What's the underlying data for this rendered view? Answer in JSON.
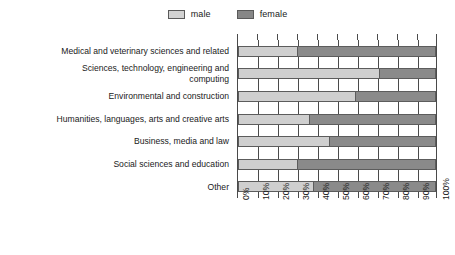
{
  "chart_data": {
    "type": "bar",
    "subtype": "stacked-horizontal-100percent",
    "title": "",
    "xlabel": "",
    "ylabel": "",
    "xlim": [
      0,
      100
    ],
    "xticks": [
      0,
      10,
      20,
      30,
      40,
      50,
      60,
      70,
      80,
      90,
      100
    ],
    "xtick_labels": [
      "0%",
      "10%",
      "20%",
      "30%",
      "40%",
      "50%",
      "60%",
      "70%",
      "80%",
      "90%",
      "100%"
    ],
    "grid": true,
    "legend_position": "top-center",
    "categories": [
      "Medical and veterinary sciences and related",
      "Sciences, technology, engineering and computing",
      "Environmental and construction",
      "Humanities, languages, arts and creative arts",
      "Business, media and law",
      "Social sciences and education",
      "Other"
    ],
    "series": [
      {
        "name": "male",
        "color": "#cfcfcf",
        "values": [
          30,
          71,
          59,
          36,
          46,
          30,
          38
        ]
      },
      {
        "name": "female",
        "color": "#8a8a8a",
        "values": [
          70,
          29,
          41,
          64,
          54,
          70,
          62
        ]
      }
    ]
  },
  "legend": {
    "items": [
      {
        "label": "male",
        "swatch": "male-swatch"
      },
      {
        "label": "female",
        "swatch": "female-swatch"
      }
    ]
  },
  "colors": {
    "male": "#cfcfcf",
    "female": "#8a8a8a",
    "axis": "#4a4a4a",
    "text": "#1a1a1a",
    "background": "#ffffff"
  }
}
